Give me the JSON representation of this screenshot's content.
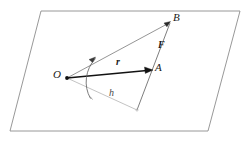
{
  "figure": {
    "width": 249,
    "height": 143,
    "background_color": "#ffffff"
  },
  "colors": {
    "plane_outline": "#8c8c8c",
    "construction_line": "#777777",
    "vector_dark": "#111111",
    "moment_arm_line": "#b0b0b0",
    "arc": "#555555",
    "label_text": "#1a1a1a"
  },
  "labels": {
    "origin": "O",
    "point_a": "A",
    "point_b": "B",
    "vector_r": "r",
    "vector_f": "F",
    "moment_arm": "h"
  },
  "geometry": {
    "plane_corners": [
      {
        "name": "top-left",
        "x": 41,
        "y": 11
      },
      {
        "name": "top-right",
        "x": 240,
        "y": 11
      },
      {
        "name": "bottom-right",
        "x": 208,
        "y": 131
      },
      {
        "name": "bottom-left",
        "x": 10,
        "y": 131
      }
    ],
    "points": {
      "O": {
        "x": 67,
        "y": 78
      },
      "A": {
        "x": 152,
        "y": 70
      },
      "B": {
        "x": 170,
        "y": 22
      },
      "H": {
        "x": 137,
        "y": 110
      }
    },
    "arc": {
      "center_x": 67,
      "center_y": 78,
      "radius": 30,
      "start_angle_deg": -38,
      "end_angle_deg": 22
    }
  },
  "label_positions": {
    "origin": {
      "x": 55,
      "y": 70
    },
    "point_a": {
      "x": 155,
      "y": 64
    },
    "point_b": {
      "x": 173,
      "y": 13
    },
    "vector_r": {
      "x": 117,
      "y": 59
    },
    "vector_f": {
      "x": 159,
      "y": 42
    },
    "moment_arm": {
      "x": 110,
      "y": 93
    }
  },
  "icon_names": {
    "arrow_r": "vector-arrowhead-icon",
    "arrow_f": "vector-arrowhead-icon",
    "arc_arrow": "rotation-arrowhead-icon",
    "origin_dot": "point-marker-icon",
    "foot_dot": "point-marker-icon"
  }
}
